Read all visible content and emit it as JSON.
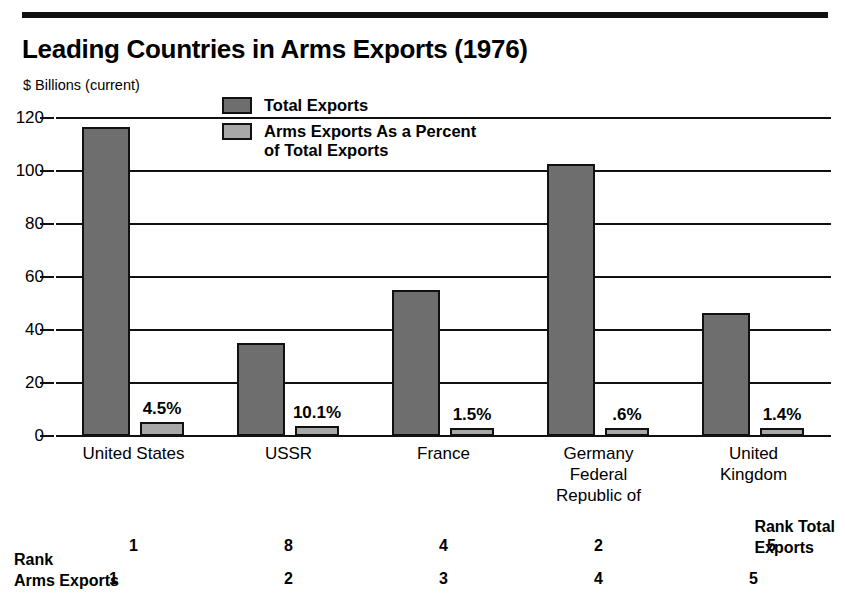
{
  "chart_data": {
    "type": "bar",
    "title": "Leading Countries in Arms Exports (1976)",
    "ylabel": "$ Billions (current)",
    "xlabel": "",
    "ylim": [
      0,
      120
    ],
    "yticks": [
      0,
      20,
      40,
      60,
      80,
      100,
      120
    ],
    "grid": true,
    "legend_position": "top-center",
    "categories": [
      "United States",
      "USSR",
      "France",
      "Germany\nFederal\nRepublic of",
      "United\nKingdom"
    ],
    "series": [
      {
        "name": "Total Exports",
        "color": "#6e6e6e",
        "values": [
          116.5,
          35.2,
          55.0,
          102.5,
          46.5
        ]
      },
      {
        "name": "Arms Exports As a Percent\nof Total Exports",
        "color": "#a8a8a8",
        "values": [
          5.2,
          3.6,
          2.2,
          1.0,
          1.8
        ]
      }
    ],
    "point_labels": [
      "4.5%",
      "10.1%",
      "1.5%",
      ".6%",
      "1.4%"
    ],
    "annotations": {
      "rank_total_exports": {
        "label": "Rank Total\nExports",
        "values": [
          "1",
          "8",
          "4",
          "2",
          "5"
        ]
      },
      "rank_arms_exports": {
        "label": "Rank\nArms Exports",
        "values": [
          "1",
          "2",
          "3",
          "4",
          "5"
        ]
      }
    }
  },
  "chart": {
    "title": "Leading Countries in Arms Exports (1976)",
    "y_axis_label": "$ Billions (current)",
    "y_ticks": [
      "120",
      "100",
      "80",
      "60",
      "40",
      "20",
      "0"
    ],
    "legend": [
      {
        "swatch": "dark",
        "label": "Total Exports"
      },
      {
        "swatch": "light",
        "label": "Arms Exports As a Percent\nof Total Exports"
      }
    ],
    "categories": [
      "United States",
      "USSR",
      "France",
      "Germany\nFederal\nRepublic of",
      "United\nKingdom"
    ],
    "percent_labels": [
      "4.5%",
      "10.1%",
      "1.5%",
      ".6%",
      "1.4%"
    ],
    "rank_total_label": "Rank Total\nExports",
    "rank_total_values": [
      "1",
      "8",
      "4",
      "2",
      "5"
    ],
    "rank_arms_label": "Rank\nArms Exports",
    "rank_arms_values": [
      "1",
      "2",
      "3",
      "4",
      "5"
    ]
  },
  "colors": {
    "total_bar": "#6e6e6e",
    "arms_bar": "#a8a8a8",
    "ink": "#111111",
    "background": "#ffffff"
  }
}
